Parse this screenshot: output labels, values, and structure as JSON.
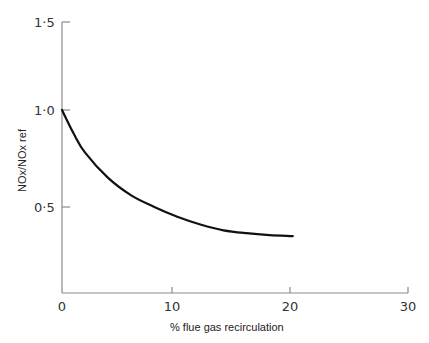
{
  "chart_data": {
    "type": "line",
    "title": "",
    "xlabel": "% flue gas recirculation",
    "ylabel": "NOx/NOx ref",
    "xlim": [
      0,
      30
    ],
    "ylim": [
      0,
      1.5
    ],
    "x_ticks": [
      0,
      10,
      20,
      30
    ],
    "x_tick_labels": [
      "0",
      "10",
      "20",
      "30"
    ],
    "y_ticks": [
      0.5,
      1.0,
      1.5
    ],
    "y_tick_labels": [
      "0·5",
      "1·0",
      "1·5"
    ],
    "grid": false,
    "legend": null,
    "series": [
      {
        "name": "NOx/NOx ref",
        "x": [
          0,
          1,
          2,
          4,
          6,
          8,
          10,
          12,
          14,
          16,
          18,
          20
        ],
        "y": [
          1.0,
          0.88,
          0.78,
          0.65,
          0.56,
          0.5,
          0.45,
          0.41,
          0.38,
          0.365,
          0.355,
          0.35
        ]
      }
    ]
  },
  "axes": {
    "x_title": "% flue gas recirculation",
    "y_title": "NOx/NOx ref",
    "x_tick_labels": [
      "0",
      "10",
      "20",
      "30"
    ],
    "y_tick_labels": [
      "0·5",
      "1·0",
      "1·5"
    ]
  },
  "colors": {
    "axis": "#808080",
    "curve": "#111111",
    "text": "#333333"
  }
}
